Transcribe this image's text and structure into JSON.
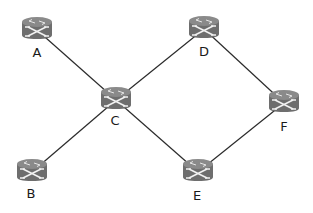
{
  "diagram": {
    "type": "network-topology",
    "node_icon": "router-icon",
    "colors": {
      "router_body": "#6e6e6e",
      "router_top": "#8a8a8a",
      "router_arrows": "#f2f2f2",
      "edge": "#2b2b2b",
      "label": "#1a1a1a",
      "background": "#ffffff"
    },
    "nodes": [
      {
        "id": "A",
        "label": "A",
        "x": 37,
        "y": 30,
        "lx": 37,
        "ly": 57
      },
      {
        "id": "B",
        "label": "B",
        "x": 32,
        "y": 172,
        "lx": 31,
        "ly": 198
      },
      {
        "id": "C",
        "label": "C",
        "x": 116,
        "y": 100,
        "lx": 115,
        "ly": 125
      },
      {
        "id": "D",
        "label": "D",
        "x": 204,
        "y": 29,
        "lx": 204,
        "ly": 56
      },
      {
        "id": "E",
        "label": "E",
        "x": 198,
        "y": 172,
        "lx": 197,
        "ly": 200
      },
      {
        "id": "F",
        "label": "F",
        "x": 284,
        "y": 103,
        "lx": 284,
        "ly": 131
      }
    ],
    "edges": [
      {
        "from": "A",
        "to": "C"
      },
      {
        "from": "C",
        "to": "D"
      },
      {
        "from": "D",
        "to": "F"
      },
      {
        "from": "C",
        "to": "B"
      },
      {
        "from": "C",
        "to": "E"
      },
      {
        "from": "E",
        "to": "F"
      }
    ]
  }
}
